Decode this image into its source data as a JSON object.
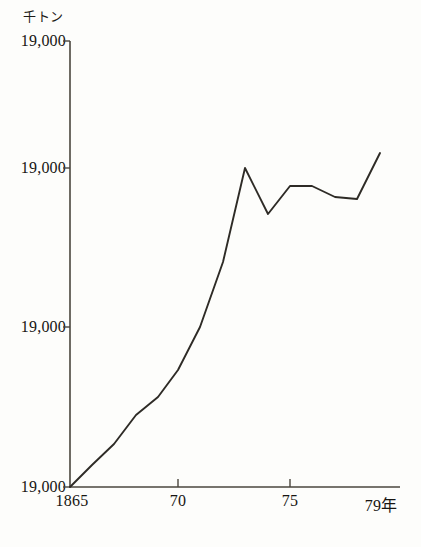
{
  "chart_data": {
    "type": "line",
    "title": "",
    "subtitle": "",
    "unit_label": "千トン",
    "xlabel": "年",
    "ylabel": "",
    "grid": false,
    "legend": null,
    "x": [
      1865,
      1866,
      1867,
      1868,
      1869,
      1870,
      1871,
      1872,
      1873,
      1874,
      1875,
      1876,
      1877,
      1878,
      1879
    ],
    "series": [
      {
        "name": "生産量",
        "values": [
          0,
          11,
          19,
          24,
          28,
          33,
          40,
          56,
          75,
          58,
          67,
          68,
          64,
          63,
          78
        ]
      }
    ],
    "y_tick_labels": [
      "19,000",
      "19,000",
      "19,000",
      "19,000"
    ],
    "y_tick_positions": [
      487,
      327,
      168,
      41
    ],
    "x_tick_labels": [
      "1865",
      "70",
      "75",
      "79年"
    ],
    "x_tick_values": [
      1865,
      1870,
      1875,
      1879
    ],
    "xlim": [
      1865,
      1880.2
    ],
    "ylim": [
      0,
      82
    ],
    "axis_origin": {
      "x": 70,
      "y": 487
    },
    "axis_top": 41,
    "axis_right": 400,
    "line_color": "#2e2b26",
    "axis_color": "#4a463e",
    "background_color": "#fdfdfb",
    "points_px": [
      {
        "x": 70,
        "y": 487
      },
      {
        "x": 92,
        "y": 465
      },
      {
        "x": 114,
        "y": 444
      },
      {
        "x": 136,
        "y": 415
      },
      {
        "x": 158,
        "y": 397
      },
      {
        "x": 178,
        "y": 370
      },
      {
        "x": 200,
        "y": 327
      },
      {
        "x": 223,
        "y": 262
      },
      {
        "x": 245,
        "y": 168
      },
      {
        "x": 268,
        "y": 214
      },
      {
        "x": 290,
        "y": 186
      },
      {
        "x": 312,
        "y": 186
      },
      {
        "x": 335,
        "y": 197
      },
      {
        "x": 357,
        "y": 199
      },
      {
        "x": 380,
        "y": 153
      }
    ]
  }
}
